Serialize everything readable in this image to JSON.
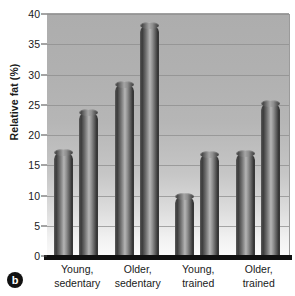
{
  "chart_data": {
    "type": "bar",
    "title": "",
    "subtitle": "",
    "panel_label": "b",
    "xlabel": "",
    "ylabel": "Relative fat (%)",
    "ylim": [
      0,
      40
    ],
    "yticks": [
      0,
      5,
      10,
      15,
      20,
      25,
      30,
      35,
      40
    ],
    "ytick_labels": [
      "0",
      "5",
      "10",
      "15",
      "20",
      "25",
      "30",
      "35",
      "40"
    ],
    "grid": "horizontal",
    "legend": "none",
    "categories": [
      "Young, sedentary",
      "Older, sedentary",
      "Young, trained",
      "Older, trained"
    ],
    "category_lines": [
      [
        "Young,",
        "sedentary"
      ],
      [
        "Older,",
        "sedentary"
      ],
      [
        "Young,",
        "trained"
      ],
      [
        "Older,",
        "trained"
      ]
    ],
    "series": [
      {
        "name": "Bar 1",
        "values": [
          17.2,
          28.5,
          9.9,
          17.0
        ]
      },
      {
        "name": "Bar 2",
        "values": [
          23.8,
          38.2,
          16.8,
          25.3
        ]
      }
    ],
    "bars": [
      {
        "group": "Young, sedentary",
        "index": 0,
        "value": 17.2
      },
      {
        "group": "Young, sedentary",
        "index": 1,
        "value": 23.8
      },
      {
        "group": "Older, sedentary",
        "index": 0,
        "value": 28.5
      },
      {
        "group": "Older, sedentary",
        "index": 1,
        "value": 38.2
      },
      {
        "group": "Young, trained",
        "index": 0,
        "value": 9.9
      },
      {
        "group": "Young, trained",
        "index": 1,
        "value": 16.8
      },
      {
        "group": "Older, trained",
        "index": 0,
        "value": 17.0
      },
      {
        "group": "Older, trained",
        "index": 1,
        "value": 25.3
      }
    ],
    "colors": {
      "bar_dark": "#2f2f2f",
      "bar_light": "#b5b5b5",
      "plot_bg_top": "#adadad",
      "plot_bg_bottom": "#fafafa",
      "gridline": "#8d8d8d",
      "axis": "#111111",
      "text": "#1a1a1a"
    }
  },
  "axis": {
    "y_title": "Relative fat (%)"
  },
  "panel": {
    "letter": "b"
  }
}
